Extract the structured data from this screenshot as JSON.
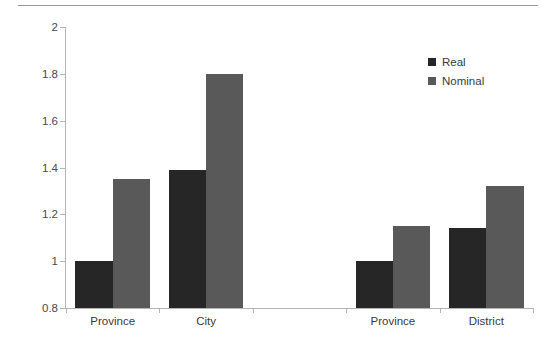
{
  "chart_data": {
    "type": "bar",
    "title": "",
    "subtitle": "",
    "xlabel": "",
    "ylabel": "",
    "categories": [
      "Province",
      "City",
      "",
      "Province",
      "District"
    ],
    "series": [
      {
        "name": "Real",
        "color": "#262626",
        "values": [
          1.0,
          1.39,
          null,
          1.0,
          1.14
        ]
      },
      {
        "name": "Nominal",
        "color": "#595959",
        "values": [
          1.35,
          1.8,
          null,
          1.15,
          1.32
        ]
      }
    ],
    "ylim": [
      0.8,
      2.0
    ],
    "yticks": [
      0.8,
      1,
      1.2,
      1.4,
      1.6,
      1.8,
      2
    ],
    "ytick_labels": [
      "0.8",
      "1",
      "1.2",
      "1.4",
      "1.6",
      "1.8",
      "2"
    ],
    "grid": false,
    "legend_position": "top-right",
    "annotations": []
  },
  "axes": {
    "y": {
      "ticks": [
        {
          "value": 2,
          "label": "2"
        },
        {
          "value": 1.8,
          "label": "1.8"
        },
        {
          "value": 1.6,
          "label": "1.6"
        },
        {
          "value": 1.4,
          "label": "1.4"
        },
        {
          "value": 1.2,
          "label": "1.2"
        },
        {
          "value": 1,
          "label": "1"
        },
        {
          "value": 0.8,
          "label": "0.8"
        }
      ]
    },
    "x": {
      "ticks": [
        {
          "label": "Province"
        },
        {
          "label": "City"
        },
        {
          "label": ""
        },
        {
          "label": "Province"
        },
        {
          "label": "District"
        }
      ]
    }
  },
  "legend": {
    "items": [
      {
        "label": "Real",
        "color": "#262626"
      },
      {
        "label": "Nominal",
        "color": "#595959"
      }
    ]
  }
}
